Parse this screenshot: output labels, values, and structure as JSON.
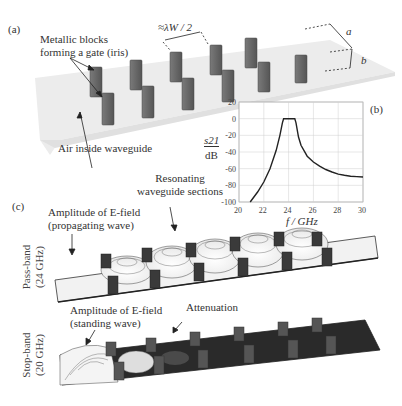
{
  "panel_a": {
    "label": "(a)",
    "blocks_label_line1": "Metallic blocks",
    "blocks_label_line2": "forming a gate (iris)",
    "spacing_label": "≈λW / 2",
    "dim_a": "a",
    "dim_b": "b",
    "air_label": "Air inside waveguide"
  },
  "panel_b": {
    "label": "(b)",
    "ylabel_top": "s21",
    "ylabel_bottom": "dB",
    "xlabel": "f / GHz"
  },
  "panel_c": {
    "label": "(c)",
    "resonating_line1": "Resonating",
    "resonating_line2": "waveguide sections",
    "prop_line1": "Amplitude of E-field",
    "prop_line2": "(propagating wave)",
    "passband_line1": "Pass-band",
    "passband_line2": "(24 GHz)",
    "stand_line1": "Amplitude of E-field",
    "stand_line2": "(standing wave)",
    "attenuation": "Attenuation",
    "stopband_line1": "Stop-band",
    "stopband_line2": "(20 GHz)"
  },
  "colors": {
    "block": "#6e6e6e",
    "waveguide_floor": "#e6e6e6",
    "curve": "#222222",
    "grid": "#cfcfcf",
    "stopband_floor": "#2a2a2a"
  },
  "chart_data": {
    "type": "line",
    "title": "",
    "xlabel": "f / GHz",
    "ylabel": "s21 / dB",
    "xlim": [
      20,
      30
    ],
    "ylim": [
      -100,
      20
    ],
    "xticks": [
      20,
      22,
      24,
      26,
      28,
      30
    ],
    "yticks": [
      20,
      0,
      -20,
      -40,
      -60,
      -80,
      -100
    ],
    "grid": true,
    "series": [
      {
        "name": "s21",
        "x": [
          20.9,
          21.5,
          22.0,
          22.5,
          23.0,
          23.3,
          23.5,
          23.6,
          24.0,
          24.5,
          24.6,
          24.8,
          25.0,
          25.5,
          26.0,
          26.5,
          27.0,
          27.5,
          28.0,
          28.5,
          29.0,
          29.5,
          30.0
        ],
        "y": [
          -100,
          -88,
          -76,
          -60,
          -38,
          -20,
          -5,
          0,
          0,
          0,
          -5,
          -22,
          -32,
          -45,
          -52,
          -57,
          -61,
          -64,
          -66.5,
          -68,
          -69,
          -69.5,
          -70
        ]
      }
    ]
  }
}
